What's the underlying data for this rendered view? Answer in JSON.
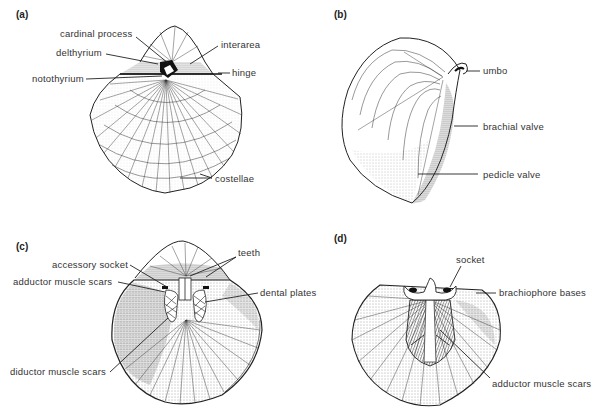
{
  "figure": {
    "panels": [
      {
        "id": "a",
        "label": "(a)",
        "labels": [
          "cardinal process",
          "delthyrium",
          "interarea",
          "hinge",
          "notothyrium",
          "costellae"
        ]
      },
      {
        "id": "b",
        "label": "(b)",
        "labels": [
          "umbo",
          "brachial valve",
          "pedicle valve"
        ]
      },
      {
        "id": "c",
        "label": "(c)",
        "labels": [
          "accessory socket",
          "teeth",
          "adductor muscle scars",
          "dental plates",
          "diductor muscle scars"
        ]
      },
      {
        "id": "d",
        "label": "(d)",
        "labels": [
          "socket",
          "brachiophore bases",
          "adductor muscle scars"
        ]
      }
    ]
  },
  "colors": {
    "ink": "#222222",
    "background": "#ffffff",
    "stipple": "#555555"
  }
}
